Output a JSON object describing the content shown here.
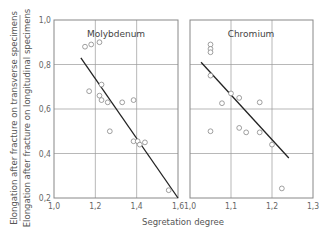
{
  "chart_data": [
    {
      "type": "scatter",
      "title": "Molybdenum",
      "xlabel": "Segretation degree",
      "ylabel": "Elongation after fracture on transverse specimens / Elongation after fracture on longitudinal specimens",
      "xlim": [
        1.0,
        1.6
      ],
      "ylim": [
        0.2,
        1.0
      ],
      "xticks": [
        "1,0",
        "1,2",
        "1,4",
        "1,6"
      ],
      "yticks": [
        "0,2",
        "0,4",
        "0,6",
        "0,8",
        "1,0"
      ],
      "grid": true,
      "points": [
        [
          1.15,
          0.88
        ],
        [
          1.18,
          0.89
        ],
        [
          1.22,
          0.9
        ],
        [
          1.17,
          0.68
        ],
        [
          1.23,
          0.71
        ],
        [
          1.22,
          0.66
        ],
        [
          1.23,
          0.64
        ],
        [
          1.26,
          0.63
        ],
        [
          1.33,
          0.63
        ],
        [
          1.385,
          0.64
        ],
        [
          1.27,
          0.5
        ],
        [
          1.385,
          0.455
        ],
        [
          1.405,
          0.455
        ],
        [
          1.415,
          0.44
        ],
        [
          1.44,
          0.45
        ],
        [
          1.555,
          0.235
        ]
      ],
      "fit_line": [
        [
          1.13,
          0.83
        ],
        [
          1.6,
          0.2
        ]
      ]
    },
    {
      "type": "scatter",
      "title": "Chromium",
      "xlabel": "Segretation degree",
      "xlim": [
        1.0,
        1.3
      ],
      "ylim": [
        0.2,
        1.0
      ],
      "xticks": [
        "1,0",
        "1,1",
        "1,2",
        "1,3"
      ],
      "grid": true,
      "points": [
        [
          1.05,
          0.89
        ],
        [
          1.05,
          0.87
        ],
        [
          1.05,
          0.855
        ],
        [
          1.05,
          0.75
        ],
        [
          1.1,
          0.67
        ],
        [
          1.12,
          0.65
        ],
        [
          1.078,
          0.626
        ],
        [
          1.17,
          0.63
        ],
        [
          1.05,
          0.5
        ],
        [
          1.12,
          0.515
        ],
        [
          1.137,
          0.495
        ],
        [
          1.17,
          0.495
        ],
        [
          1.2,
          0.44
        ],
        [
          1.224,
          0.243
        ]
      ],
      "fit_line": [
        [
          1.027,
          0.81
        ],
        [
          1.241,
          0.38
        ]
      ]
    }
  ],
  "labels": {
    "ylabel_top": "Elongation after fracture on transverse specimens",
    "ylabel_bottom": "Elongation after fracture on longitudinal specimens",
    "xlabel": "Segretation degree",
    "panel_left_title": "Molybdenum",
    "panel_right_title": "Chromium"
  }
}
